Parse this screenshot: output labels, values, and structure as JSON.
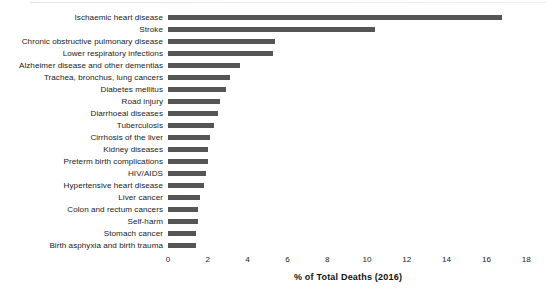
{
  "chart_data": {
    "type": "bar",
    "orientation": "horizontal",
    "title": "",
    "subtitle": "",
    "xlabel": "% of Total Deaths (2016)",
    "ylabel": "",
    "xlim": [
      0,
      18
    ],
    "xticks": [
      "0",
      "2",
      "4",
      "6",
      "8",
      "10",
      "12",
      "14",
      "16",
      "18"
    ],
    "xtick_values": [
      0,
      2,
      4,
      6,
      8,
      10,
      12,
      14,
      16,
      18
    ],
    "grid": false,
    "legend": null,
    "bar_color": "#555555",
    "categories": [
      "Ischaemic heart disease",
      "Stroke",
      "Chronic obstructive pulmonary disease",
      "Lower respiratory infections",
      "Alzheimer disease and other dementias",
      "Trachea, bronchus, lung cancers",
      "Diabetes mellitus",
      "Road injury",
      "Diarrhoeal diseases",
      "Tuberculosis",
      "Cirrhosis of the liver",
      "Kidney diseases",
      "Preterm birth complications",
      "HIV/AIDS",
      "Hypertensive heart disease",
      "Liver cancer",
      "Colon and rectum cancers",
      "Self-harm",
      "Stomach cancer",
      "Birth asphyxia and birth trauma"
    ],
    "values": [
      16.8,
      10.4,
      5.4,
      5.3,
      3.6,
      3.1,
      2.9,
      2.6,
      2.5,
      2.3,
      2.1,
      2.0,
      2.0,
      1.9,
      1.8,
      1.6,
      1.5,
      1.5,
      1.4,
      1.4
    ]
  }
}
